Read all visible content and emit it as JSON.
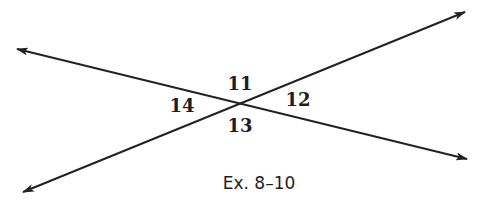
{
  "figure": {
    "caption": "Ex. 8–10",
    "line_color": "#222222",
    "intersection": {
      "x": 240,
      "y": 104
    },
    "lines": [
      {
        "name": "line-falling",
        "from": {
          "x": 17,
          "y": 49
        },
        "to": {
          "x": 467,
          "y": 159
        },
        "arrows": "both"
      },
      {
        "name": "line-rising",
        "from": {
          "x": 23,
          "y": 192
        },
        "to": {
          "x": 465,
          "y": 12
        },
        "arrows": "both"
      }
    ],
    "angles": [
      {
        "label": "11",
        "position": "top",
        "x": 240,
        "y": 90
      },
      {
        "label": "12",
        "position": "right",
        "x": 298,
        "y": 106
      },
      {
        "label": "13",
        "position": "bottom",
        "x": 240,
        "y": 131
      },
      {
        "label": "14",
        "position": "left",
        "x": 182,
        "y": 111
      }
    ]
  }
}
